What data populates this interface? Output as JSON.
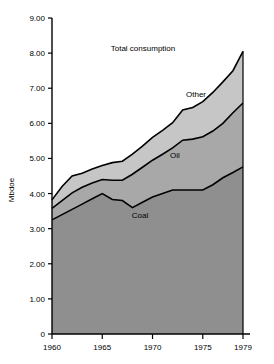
{
  "chart_data": {
    "type": "area",
    "title": "",
    "subtitle": "",
    "xlabel": "",
    "ylabel": "Mbdoe",
    "stacked": true,
    "grid": false,
    "legend_position": "inline-annotations",
    "xlim": [
      1960,
      1979
    ],
    "ylim": [
      0,
      9
    ],
    "x_ticks": [
      "1960",
      "1965",
      "1970",
      "1975",
      "1979"
    ],
    "x_tick_values": [
      1960,
      1965,
      1970,
      1975,
      1979
    ],
    "y_ticks": [
      "0",
      "1.00",
      "2.00",
      "3.00",
      "4.00",
      "5.00",
      "6.00",
      "7.00",
      "8.00",
      "9.00"
    ],
    "y_tick_values": [
      0,
      1,
      2,
      3,
      4,
      5,
      6,
      7,
      8,
      9
    ],
    "x": [
      1960,
      1961,
      1962,
      1963,
      1964,
      1965,
      1966,
      1967,
      1968,
      1969,
      1970,
      1971,
      1972,
      1973,
      1974,
      1975,
      1976,
      1977,
      1978,
      1979
    ],
    "series": [
      {
        "name": "Coal",
        "label": "Coal",
        "color": "#8f8f8f",
        "cumulative_top_values": [
          3.25,
          3.4,
          3.55,
          3.7,
          3.85,
          4.0,
          3.83,
          3.8,
          3.6,
          3.75,
          3.9,
          4.0,
          4.1,
          4.1,
          4.1,
          4.1,
          4.25,
          4.45,
          4.6,
          4.76
        ]
      },
      {
        "name": "Oil",
        "label": "Oil",
        "color": "#a8a8a8",
        "cumulative_top_values": [
          3.58,
          3.8,
          4.02,
          4.18,
          4.3,
          4.4,
          4.38,
          4.38,
          4.55,
          4.75,
          4.95,
          5.12,
          5.3,
          5.52,
          5.55,
          5.62,
          5.78,
          6.0,
          6.3,
          6.58
        ]
      },
      {
        "name": "Other",
        "label": "Other",
        "color": "#c6c6c6"
      }
    ],
    "total": {
      "name": "Total consumption",
      "label": "Total consumption",
      "values": [
        3.82,
        4.2,
        4.5,
        4.58,
        4.7,
        4.8,
        4.88,
        4.92,
        5.12,
        5.35,
        5.6,
        5.8,
        6.02,
        6.38,
        6.45,
        6.62,
        6.88,
        7.18,
        7.5,
        8.05
      ]
    },
    "annotations": [
      {
        "text": "Total consumption",
        "x_px": 143,
        "y_px": 51
      },
      {
        "text": "Other",
        "x_px": 196,
        "y_px": 97
      },
      {
        "text": "Oil",
        "x_px": 175,
        "y_px": 158
      },
      {
        "text": "Coal",
        "x_px": 140,
        "y_px": 218
      }
    ]
  }
}
